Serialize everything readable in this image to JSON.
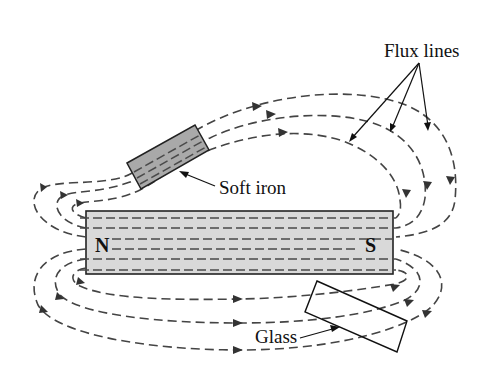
{
  "diagram": {
    "labels": {
      "flux_lines": "Flux lines",
      "soft_iron": "Soft iron",
      "glass": "Glass"
    },
    "poles": {
      "north": "N",
      "south": "S"
    },
    "colors": {
      "background": "#ffffff",
      "magnet_fill": "#d9d9d9",
      "soft_iron_fill": "#a9a9a9",
      "glass_fill": "#ffffff",
      "line": "#444444",
      "outline": "#222222"
    },
    "elements": [
      {
        "name": "bar-magnet",
        "type": "rectangle",
        "x": 86,
        "y": 211,
        "width": 307,
        "height": 63
      },
      {
        "name": "soft-iron-piece",
        "type": "rotated-rectangle"
      },
      {
        "name": "glass-piece",
        "type": "rotated-rectangle"
      },
      {
        "name": "flux-lines",
        "type": "dashed-curves-with-arrows"
      }
    ]
  }
}
